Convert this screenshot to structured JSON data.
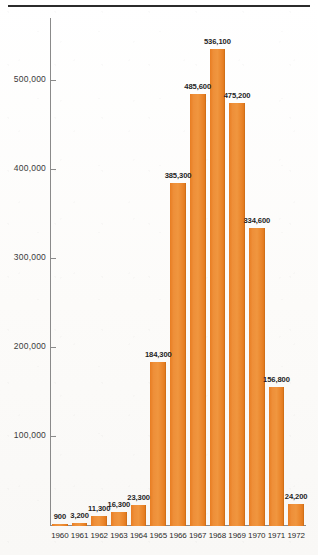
{
  "chart_data": {
    "type": "bar",
    "title": "",
    "subtitle": "",
    "xlabel": "",
    "ylabel": "",
    "categories": [
      "1960",
      "1961",
      "1962",
      "1963",
      "1964",
      "1965",
      "1966",
      "1967",
      "1968",
      "1969",
      "1970",
      "1971",
      "1972"
    ],
    "values": [
      900,
      3200,
      11300,
      16300,
      23300,
      184300,
      385300,
      485600,
      536100,
      475200,
      334600,
      156800,
      24200
    ],
    "value_labels": [
      "900",
      "3,200",
      "11,300",
      "16,300",
      "23,300",
      "184,300",
      "385,300",
      "485,600",
      "536,100",
      "475,200",
      "334,600",
      "156,800",
      "24,200"
    ],
    "ylim": [
      0,
      570000
    ],
    "yticks": [
      100000,
      200000,
      300000,
      400000,
      500000
    ],
    "ytick_labels": [
      "100,000",
      "200,000",
      "300,000",
      "400,000",
      "500,000"
    ],
    "grid": false,
    "legend": null,
    "bar_color": "#ee8f39",
    "axis_color": "#8a8a8a",
    "text_color": "#2a2a2a",
    "rule_color": "#2b2b2b"
  }
}
